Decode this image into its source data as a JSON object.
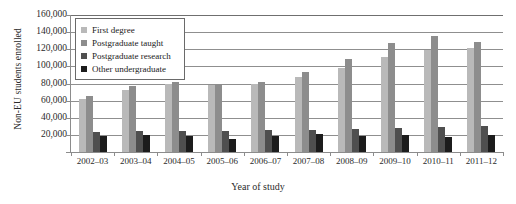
{
  "chart_data": {
    "type": "bar",
    "title": "",
    "xlabel": "Year of study",
    "ylabel": "Non-EU students enrolled",
    "ylim": [
      0,
      160000
    ],
    "ytick_values": [
      0,
      20000,
      40000,
      60000,
      80000,
      100000,
      120000,
      140000,
      160000
    ],
    "ytick_labels": [
      "",
      "20,000",
      "40,000",
      "60,000",
      "80,000",
      "100,000",
      "120,000",
      "140,000",
      "160,000"
    ],
    "grid": true,
    "legend_position": "upper-left-inside",
    "categories": [
      "2002–03",
      "2003–04",
      "2004–05",
      "2005–06",
      "2006–07",
      "2007–08",
      "2008–09",
      "2009–10",
      "2010–11",
      "2011–12"
    ],
    "series": [
      {
        "name": "First degree",
        "color": "#b9b9b9",
        "values": [
          62000,
          73000,
          79000,
          78000,
          80000,
          88000,
          98000,
          111000,
          119000,
          122000
        ]
      },
      {
        "name": "Postgraduate taught",
        "color": "#8d8d8d",
        "values": [
          65000,
          77000,
          82000,
          80000,
          82000,
          93000,
          109000,
          127000,
          135000,
          128000
        ]
      },
      {
        "name": "Postgraduate research",
        "color": "#4f4f4f",
        "values": [
          23000,
          24000,
          25000,
          25000,
          26000,
          26000,
          27000,
          28000,
          29000,
          30000
        ]
      },
      {
        "name": "Other undergraduate",
        "color": "#1c1c1c",
        "values": [
          19000,
          20000,
          19000,
          15000,
          19000,
          21000,
          19000,
          20000,
          18000,
          20000
        ]
      }
    ]
  }
}
